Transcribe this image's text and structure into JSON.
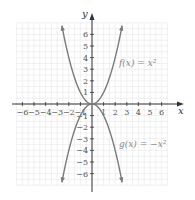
{
  "chart_data": {
    "type": "line",
    "title": "",
    "xlabel": "x",
    "ylabel": "y",
    "xlim": [
      -6.5,
      7
    ],
    "ylim": [
      -7,
      7.5
    ],
    "grid": true,
    "x_ticks": [
      -6,
      -5,
      -4,
      -3,
      -2,
      -1,
      1,
      2,
      3,
      4,
      5,
      6
    ],
    "y_ticks": [
      -6,
      -5,
      -4,
      -3,
      -2,
      -1,
      1,
      2,
      3,
      4,
      5,
      6
    ],
    "series": [
      {
        "name": "f(x) = x^2",
        "label": "f(x) = x²",
        "expression": "x^2",
        "domain": [
          -2.6,
          2.6
        ],
        "color": "#7a7a7a"
      },
      {
        "name": "g(x) = -x^2",
        "label": "g(x) = −x²",
        "expression": "-x^2",
        "domain": [
          -2.6,
          2.6
        ],
        "color": "#7a7a7a"
      }
    ],
    "annotations": [
      {
        "text": "f(x) = x²",
        "x": 2.3,
        "y": 3.5
      },
      {
        "text": "g(x) = −x²",
        "x": 2.3,
        "y": -3.5
      }
    ]
  },
  "labels": {
    "x_axis": "x",
    "y_axis": "y",
    "f_label": "f(x) = x²",
    "g_label": "g(x) = −x²"
  }
}
